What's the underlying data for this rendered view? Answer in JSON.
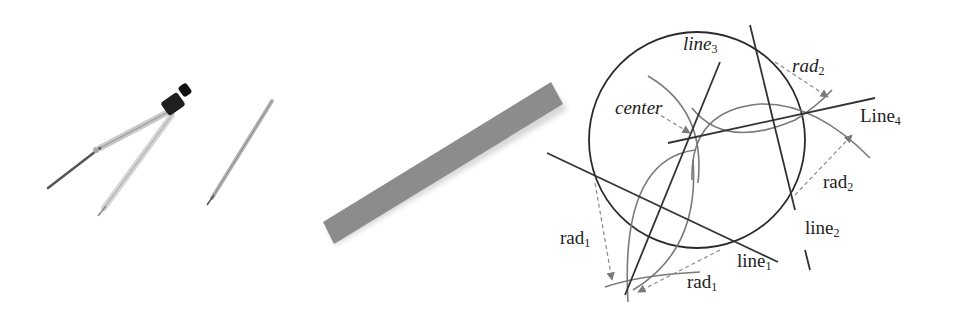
{
  "figure": {
    "panels": [
      {
        "id": "tools",
        "items": [
          "compass",
          "pencil"
        ]
      },
      {
        "id": "ruler",
        "items": [
          "straightedge"
        ]
      },
      {
        "id": "construction",
        "items": [
          "circle",
          "line1",
          "line2",
          "line3",
          "Line4",
          "arcs",
          "center"
        ]
      }
    ],
    "colors": {
      "ruler": "#8c8c8c",
      "circle": "#2a2a2a",
      "lines": "#3a3a3a",
      "arcs": "#7a7a7a",
      "arrows": "#8a8a8a",
      "compass_head": "#1a1a1a"
    },
    "labels": {
      "line3": {
        "base": "line",
        "sub": "3"
      },
      "center": {
        "text": "center"
      },
      "rad2_top": {
        "base": "rad",
        "sub": "2"
      },
      "line4": {
        "base": "Line",
        "sub": "4"
      },
      "rad2_right": {
        "base": "rad",
        "sub": "2"
      },
      "line2": {
        "base": "line",
        "sub": "2"
      },
      "line1": {
        "base": "line",
        "sub": "1"
      },
      "rad1_left": {
        "base": "rad",
        "sub": "1"
      },
      "rad1_bottom": {
        "base": "rad",
        "sub": "1"
      }
    }
  }
}
